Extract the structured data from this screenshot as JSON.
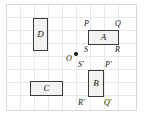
{
  "figure": {
    "canvas": {
      "width": 144,
      "height": 116
    },
    "grid": {
      "enabled": true,
      "cell_size": 14,
      "line_color": "#e6e6e6",
      "border_color": "#d8d8d8"
    },
    "shapes": [
      {
        "id": "D",
        "label": "D",
        "orientation": "vertical",
        "fill": "#f2f2f2",
        "stroke": "#3a3a3a"
      },
      {
        "id": "C",
        "label": "C",
        "orientation": "horizontal",
        "fill": "#f2f2f2",
        "stroke": "#3a3a3a"
      },
      {
        "id": "A",
        "label": "A",
        "orientation": "horizontal",
        "fill": "#f2f2f2",
        "stroke": "#3a3a3a"
      },
      {
        "id": "B",
        "label": "B",
        "orientation": "vertical",
        "fill": "#f2f2f2",
        "stroke": "#3a3a3a"
      }
    ],
    "vertex_labels": {
      "a_top_left": "P",
      "a_top_right": "Q",
      "a_bottom_left": "S",
      "a_bottom_right": "R",
      "b_top_left": "S′",
      "b_top_right": "P′",
      "b_bottom_left": "R′",
      "b_bottom_right": "Q′"
    },
    "center_point": {
      "label": "O",
      "dot_color": "#111111"
    }
  }
}
